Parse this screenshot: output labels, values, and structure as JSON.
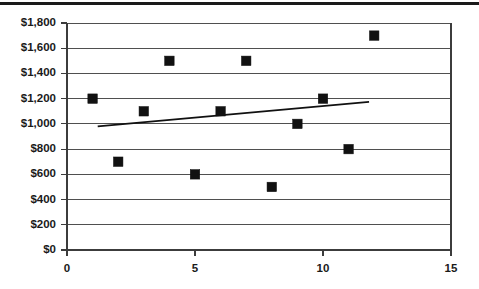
{
  "chart_data": {
    "type": "scatter",
    "title": "",
    "subtitle": "",
    "xlabel": "",
    "ylabel": "",
    "xlim": [
      0,
      15
    ],
    "ylim": [
      0,
      1800
    ],
    "grid": true,
    "legend": false,
    "legend_position": "none",
    "x_ticks": [
      0,
      5,
      10,
      15
    ],
    "x_tick_labels": [
      "0",
      "5",
      "10",
      "15"
    ],
    "y_ticks": [
      0,
      200,
      400,
      600,
      800,
      1000,
      1200,
      1400,
      1600,
      1800
    ],
    "y_tick_labels": [
      "$0",
      "$200",
      "$400",
      "$600",
      "$800",
      "$1,000",
      "$1,200",
      "$1,400",
      "$1,600",
      "$1,800"
    ],
    "series": [
      {
        "name": "Data points",
        "type": "scatter",
        "marker": "square",
        "color": "#111111",
        "x": [
          1,
          2,
          3,
          4,
          5,
          6,
          7,
          8,
          9,
          10,
          11,
          12
        ],
        "y": [
          1200,
          700,
          1100,
          1500,
          600,
          1100,
          1500,
          500,
          1000,
          1200,
          800,
          1700
        ],
        "points": [
          {
            "x": 1,
            "y": 1200
          },
          {
            "x": 2,
            "y": 700
          },
          {
            "x": 3,
            "y": 1100
          },
          {
            "x": 4,
            "y": 1500
          },
          {
            "x": 5,
            "y": 600
          },
          {
            "x": 6,
            "y": 1100
          },
          {
            "x": 7,
            "y": 1500
          },
          {
            "x": 8,
            "y": 500
          },
          {
            "x": 9,
            "y": 1000
          },
          {
            "x": 10,
            "y": 1200
          },
          {
            "x": 11,
            "y": 800
          },
          {
            "x": 12,
            "y": 1700
          }
        ]
      },
      {
        "name": "Linear trendline",
        "type": "line",
        "color": "#111111",
        "x": [
          1.2,
          11.8
        ],
        "y": [
          980,
          1175
        ]
      }
    ],
    "colors": {
      "marker": "#111111",
      "trendline": "#111111",
      "gridline": "#3c3c3c",
      "axis": "#3c3c3c",
      "text": "#1a1a1a",
      "background": "#ffffff",
      "top_rule": "#1a1a1a"
    }
  }
}
